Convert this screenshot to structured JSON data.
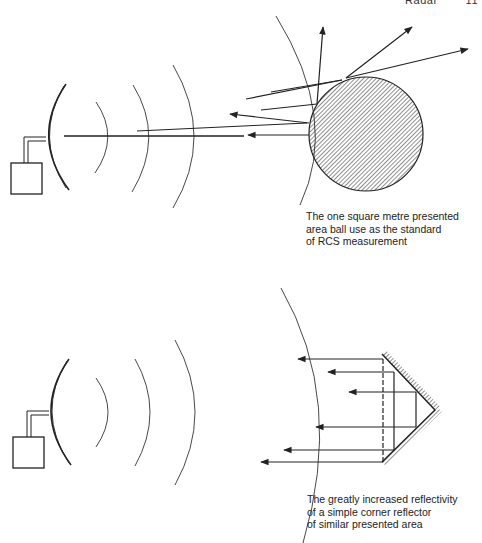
{
  "header": {
    "section": "Radar",
    "page": "11"
  },
  "figures": [
    {
      "id": "sphere-reflection",
      "target": "sphere",
      "caption": "The one square metre presented\narea ball use as the standard\nof RCS measurement"
    },
    {
      "id": "corner-reflector",
      "target": "corner reflector",
      "caption": "The greatly increased reflectivity\nof a simple corner reflector\nof similar presented area"
    }
  ],
  "colors": {
    "ink": "#222222",
    "paper": "#ffffff"
  }
}
